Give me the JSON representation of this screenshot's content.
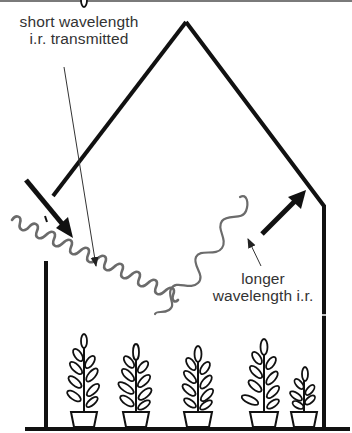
{
  "diagram": {
    "labels": {
      "short_wavelength": {
        "line1": "short wavelength",
        "line2": "i.r. transmitted"
      },
      "longer_wavelength": {
        "line1": "longer",
        "line2": "wavelength i.r."
      }
    },
    "elements": {
      "greenhouse": "greenhouse-outline",
      "incoming_radiation": "short-wavelength-wave",
      "emitted_radiation": "long-wavelength-wave",
      "incoming_arrow": "arrow-in",
      "reflected_arrow": "arrow-out",
      "plants_count": 5
    },
    "colors": {
      "outline": "#111111",
      "wave": "#6b6b6b",
      "text": "#333333",
      "top_border": "#7a7a7a"
    }
  }
}
